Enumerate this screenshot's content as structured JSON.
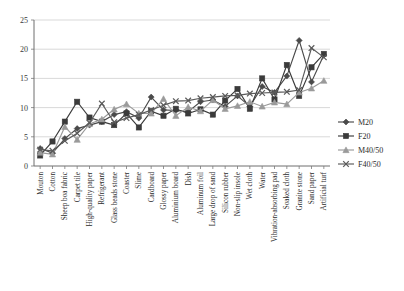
{
  "chart_data": {
    "type": "line",
    "title": "",
    "xlabel": "",
    "ylabel": "",
    "ylim": [
      0,
      25
    ],
    "yticks": [
      0,
      5,
      10,
      15,
      20,
      25
    ],
    "grid": true,
    "legend_position": "right",
    "categories": [
      "Mouton",
      "Cotton",
      "Sheep boa fabric",
      "Carpet tile",
      "High-quality paper",
      "Refrigerant",
      "Glass beads stone",
      "Coaster",
      "Slime",
      "Cardboard",
      "Glossy paper",
      "Aluminium board",
      "Dish",
      "Aluminum foil",
      "Large drop of sand",
      "Silicon rubber",
      "Non-slip insole",
      "Wet cloth",
      "Water",
      "Vibration-absorbing pad",
      "Soaked cloth",
      "Granite stone",
      "Sand paper",
      "Artificial turf"
    ],
    "series": [
      {
        "name": "M20",
        "marker": "diamond",
        "color": "#4a4a4a",
        "values": [
          3.0,
          2.2,
          4.7,
          6.4,
          7.0,
          7.6,
          8.8,
          9.3,
          8.2,
          11.8,
          9.6,
          9.5,
          9.3,
          11.0,
          11.3,
          10.2,
          12.0,
          10.2,
          13.6,
          12.6,
          15.4,
          21.5,
          14.4,
          19.0
        ]
      },
      {
        "name": "F20",
        "marker": "square",
        "color": "#3b3b3b",
        "values": [
          1.8,
          4.2,
          7.6,
          11.0,
          8.3,
          7.6,
          7.0,
          9.0,
          6.6,
          9.4,
          8.6,
          9.8,
          9.0,
          9.7,
          8.8,
          11.2,
          13.2,
          9.8,
          15.0,
          11.4,
          17.3,
          12.0,
          16.9,
          19.2
        ]
      },
      {
        "name": "M40/50",
        "marker": "triangle",
        "color": "#9a9a9a",
        "values": [
          2.3,
          2.0,
          6.7,
          4.5,
          7.2,
          8.0,
          9.7,
          10.6,
          9.0,
          9.0,
          11.5,
          8.6,
          10.1,
          9.4,
          11.3,
          9.8,
          10.3,
          11.0,
          10.2,
          10.9,
          10.6,
          12.6,
          13.3,
          14.6
        ]
      },
      {
        "name": "F40/50",
        "marker": "cross",
        "color": "#5a5a5a",
        "values": [
          2.8,
          2.6,
          4.3,
          5.6,
          7.4,
          10.7,
          7.5,
          8.2,
          8.8,
          9.6,
          10.4,
          11.1,
          11.2,
          11.6,
          11.8,
          12.0,
          12.1,
          12.4,
          12.5,
          12.6,
          12.7,
          13.0,
          20.2,
          18.6
        ]
      }
    ]
  },
  "legend": {
    "items": [
      {
        "label": "M20"
      },
      {
        "label": "F20"
      },
      {
        "label": "M40/50"
      },
      {
        "label": "F40/50"
      }
    ]
  }
}
